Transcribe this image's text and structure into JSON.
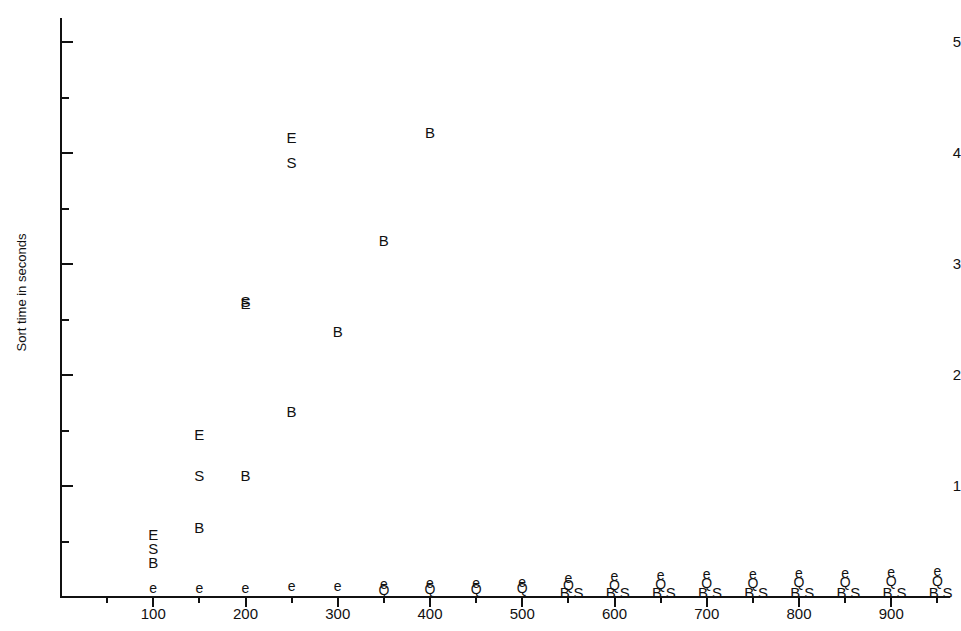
{
  "chart_data": {
    "type": "scatter",
    "title": "",
    "subtitle": "",
    "xlabel": "",
    "ylabel": "Sort time in seconds",
    "xlim": [
      0,
      970
    ],
    "ylim": [
      0,
      5.2
    ],
    "grid": false,
    "legend_position": "none",
    "x_ticks_major": [
      100,
      200,
      300,
      400,
      500,
      600,
      700,
      800,
      900
    ],
    "x_ticks_minor": [
      50,
      150,
      250,
      350,
      450,
      550,
      650,
      750,
      850,
      950
    ],
    "x_tick_labels": [
      "100",
      "200",
      "300",
      "400",
      "500",
      "600",
      "700",
      "800",
      "900"
    ],
    "y_ticks_major": [
      1,
      2,
      3,
      4,
      5
    ],
    "y_ticks_minor": [
      0.5,
      1.5,
      2.5,
      3.5,
      4.5
    ],
    "y_tick_labels": [
      "1",
      "2",
      "3",
      "4",
      "5"
    ],
    "marker_style": "letter",
    "annotation_note": "Each data point is plotted as the letter identifying its sorting algorithm series.",
    "series": [
      {
        "name": "E",
        "marker": "E",
        "points": [
          {
            "x": 100,
            "y": 0.52
          },
          {
            "x": 150,
            "y": 1.42
          },
          {
            "x": 200,
            "y": 2.6
          },
          {
            "x": 250,
            "y": 4.1
          }
        ]
      },
      {
        "name": "S",
        "marker": "S",
        "points": [
          {
            "x": 100,
            "y": 0.4
          },
          {
            "x": 150,
            "y": 1.05
          },
          {
            "x": 200,
            "y": 2.62
          },
          {
            "x": 250,
            "y": 3.87
          }
        ]
      },
      {
        "name": "B",
        "marker": "B",
        "points": [
          {
            "x": 100,
            "y": 0.27
          },
          {
            "x": 150,
            "y": 0.59
          },
          {
            "x": 200,
            "y": 1.05
          },
          {
            "x": 250,
            "y": 1.63
          },
          {
            "x": 300,
            "y": 2.35
          },
          {
            "x": 350,
            "y": 3.17
          },
          {
            "x": 400,
            "y": 4.14
          }
        ]
      },
      {
        "name": "e",
        "marker": "e",
        "points": [
          {
            "x": 100,
            "y": 0.04
          },
          {
            "x": 150,
            "y": 0.04
          },
          {
            "x": 200,
            "y": 0.04
          },
          {
            "x": 250,
            "y": 0.05
          },
          {
            "x": 300,
            "y": 0.05
          },
          {
            "x": 350,
            "y": 0.07
          },
          {
            "x": 400,
            "y": 0.08
          },
          {
            "x": 450,
            "y": 0.08
          },
          {
            "x": 500,
            "y": 0.09
          },
          {
            "x": 550,
            "y": 0.13
          },
          {
            "x": 600,
            "y": 0.14
          },
          {
            "x": 650,
            "y": 0.15
          },
          {
            "x": 700,
            "y": 0.16
          },
          {
            "x": 750,
            "y": 0.16
          },
          {
            "x": 800,
            "y": 0.17
          },
          {
            "x": 850,
            "y": 0.17
          },
          {
            "x": 900,
            "y": 0.18
          },
          {
            "x": 950,
            "y": 0.19
          }
        ]
      },
      {
        "name": "Q",
        "marker": "Q",
        "points": [
          {
            "x": 350,
            "y": 0.02
          },
          {
            "x": 400,
            "y": 0.03
          },
          {
            "x": 450,
            "y": 0.03
          },
          {
            "x": 500,
            "y": 0.04
          },
          {
            "x": 550,
            "y": 0.06
          },
          {
            "x": 600,
            "y": 0.06
          },
          {
            "x": 650,
            "y": 0.07
          },
          {
            "x": 700,
            "y": 0.08
          },
          {
            "x": 750,
            "y": 0.08
          },
          {
            "x": 800,
            "y": 0.09
          },
          {
            "x": 850,
            "y": 0.09
          },
          {
            "x": 900,
            "y": 0.1
          },
          {
            "x": 950,
            "y": 0.1
          }
        ]
      },
      {
        "name": "B-baseline",
        "marker": "B",
        "points": [
          {
            "x": 546,
            "y": 0.0
          },
          {
            "x": 596,
            "y": 0.0
          },
          {
            "x": 646,
            "y": 0.0
          },
          {
            "x": 696,
            "y": 0.0
          },
          {
            "x": 746,
            "y": 0.0
          },
          {
            "x": 796,
            "y": 0.0
          },
          {
            "x": 846,
            "y": 0.0
          },
          {
            "x": 896,
            "y": 0.0
          },
          {
            "x": 946,
            "y": 0.0
          }
        ]
      },
      {
        "name": "S-baseline",
        "marker": "S",
        "points": [
          {
            "x": 561,
            "y": 0.0
          },
          {
            "x": 611,
            "y": 0.0
          },
          {
            "x": 661,
            "y": 0.0
          },
          {
            "x": 711,
            "y": 0.0
          },
          {
            "x": 761,
            "y": 0.0
          },
          {
            "x": 811,
            "y": 0.0
          },
          {
            "x": 861,
            "y": 0.0
          },
          {
            "x": 911,
            "y": 0.0
          },
          {
            "x": 961,
            "y": 0.0
          }
        ]
      }
    ]
  },
  "axes": {
    "y_title": "Sort time in seconds"
  }
}
